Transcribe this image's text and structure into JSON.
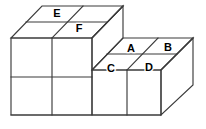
{
  "figure": {
    "background_color": "#ffffff",
    "line_color": "#3b3b3b",
    "label_color": "#000000",
    "labels": [
      {
        "id": "label-e",
        "text": "E",
        "x": 57,
        "y": 14,
        "face": "top-left-back"
      },
      {
        "id": "label-f",
        "text": "F",
        "x": 79,
        "y": 29,
        "face": "top-left-front"
      },
      {
        "id": "label-a",
        "text": "A",
        "x": 131,
        "y": 49,
        "face": "top-right-back-left"
      },
      {
        "id": "label-b",
        "text": "B",
        "x": 168,
        "y": 48,
        "face": "top-right-back-right"
      },
      {
        "id": "label-c",
        "text": "C",
        "x": 111,
        "y": 69,
        "face": "top-right-front-left"
      },
      {
        "id": "label-d",
        "text": "D",
        "x": 149,
        "y": 68,
        "face": "top-right-front-right"
      }
    ],
    "geometry": {
      "projection": "oblique",
      "depth_dx": 31,
      "depth_dy": -32,
      "unit_width": 37,
      "unit_height": 38,
      "origin": {
        "x": 11,
        "y": 115
      }
    }
  }
}
